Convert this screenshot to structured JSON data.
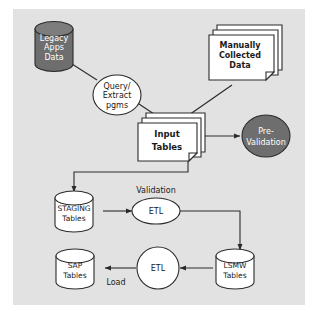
{
  "diagram": {
    "canvas": {
      "width": 318,
      "height": 314
    },
    "panel": {
      "x": 13,
      "y": 9,
      "width": 292,
      "height": 296,
      "fill": "#e2e2e2"
    },
    "colors": {
      "panel_background": "#e2e2e2",
      "page_background": "#ffffff",
      "shape_fill_light": "#ffffff",
      "shape_fill_dark": "#6e6e6e",
      "stroke": "#2b2b2b",
      "text_dark": "#1a1a1a",
      "text_light": "#ffffff"
    },
    "nodes": [
      {
        "id": "legacy-apps-data",
        "type": "cylinder",
        "style": "dark",
        "lines": [
          "Legacy",
          "Apps",
          "Data"
        ],
        "bold": false
      },
      {
        "id": "query-extract-pgms",
        "type": "ellipse",
        "style": "light",
        "lines": [
          "Query/",
          "Extract",
          "pgms"
        ],
        "bold": false
      },
      {
        "id": "manually-collected-data",
        "type": "document-stack",
        "style": "light",
        "lines": [
          "Manually",
          "Collected",
          "Data"
        ],
        "bold": true
      },
      {
        "id": "input-tables",
        "type": "document-stack",
        "style": "light",
        "lines": [
          "Input",
          "Tables"
        ],
        "bold": true
      },
      {
        "id": "pre-validation",
        "type": "ellipse",
        "style": "dark",
        "lines": [
          "Pre-",
          "Validation"
        ],
        "bold": false
      },
      {
        "id": "staging-tables",
        "type": "cylinder",
        "style": "light",
        "lines": [
          "STAGING",
          "Tables"
        ],
        "bold": false
      },
      {
        "id": "etl-validation",
        "type": "ellipse",
        "style": "light",
        "lines": [
          "ETL"
        ],
        "bold": false
      },
      {
        "id": "lsmw-tables",
        "type": "cylinder",
        "style": "light",
        "lines": [
          "LSMW",
          "Tables"
        ],
        "bold": false
      },
      {
        "id": "etl-load",
        "type": "circle",
        "style": "light",
        "lines": [
          "ETL"
        ],
        "bold": false
      },
      {
        "id": "sap-tables",
        "type": "cylinder",
        "style": "light",
        "lines": [
          "SAP",
          "Tables"
        ],
        "bold": false
      }
    ],
    "edge_labels": [
      {
        "id": "validation-label",
        "text": "Validation"
      },
      {
        "id": "load-label",
        "text": "Load"
      }
    ],
    "edges": [
      {
        "id": "legacy-to-query",
        "from": "legacy-apps-data",
        "to": "query-extract-pgms",
        "arrow": false
      },
      {
        "id": "query-to-input",
        "from": "query-extract-pgms",
        "to": "input-tables",
        "arrow": false
      },
      {
        "id": "manual-to-input",
        "from": "manually-collected-data",
        "to": "input-tables",
        "arrow": false
      },
      {
        "id": "input-to-prevalidation",
        "from": "input-tables",
        "to": "pre-validation",
        "arrow": true
      },
      {
        "id": "input-to-staging",
        "from": "input-tables",
        "to": "staging-tables",
        "arrow": true
      },
      {
        "id": "staging-to-etl",
        "from": "staging-tables",
        "to": "etl-validation",
        "arrow": true
      },
      {
        "id": "etl-to-lsmw",
        "from": "etl-validation",
        "to": "lsmw-tables",
        "arrow": true
      },
      {
        "id": "lsmw-to-etl-load",
        "from": "lsmw-tables",
        "to": "etl-load",
        "arrow": true
      },
      {
        "id": "etl-load-to-sap",
        "from": "etl-load",
        "to": "sap-tables",
        "arrow": true
      }
    ]
  },
  "text": {
    "legacy_1": "Legacy",
    "legacy_2": "Apps",
    "legacy_3": "Data",
    "query_1": "Query/",
    "query_2": "Extract",
    "query_3": "pgms",
    "manual_1": "Manually",
    "manual_2": "Collected",
    "manual_3": "Data",
    "input_1": "Input",
    "input_2": "Tables",
    "prevalidation_1": "Pre-",
    "prevalidation_2": "Validation",
    "staging_1": "STAGING",
    "staging_2": "Tables",
    "etl_validation": "ETL",
    "lsmw_1": "LSMW",
    "lsmw_2": "Tables",
    "etl_load": "ETL",
    "sap_1": "SAP",
    "sap_2": "Tables",
    "validation_label": "Validation",
    "load_label": "Load"
  }
}
